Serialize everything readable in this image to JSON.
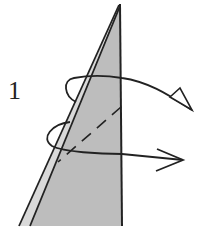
{
  "diagram": {
    "type": "origami-folding-step",
    "step_number": "1",
    "colors": {
      "paper_fill": "#bdbdbd",
      "line": "#222222",
      "background": "#ffffff"
    },
    "elements": [
      {
        "name": "folded-paper-flap",
        "shape": "narrow triangle, apex at top, shaded gray"
      },
      {
        "name": "valley-fold-line",
        "style": "dashed"
      },
      {
        "name": "turn-over-arrow",
        "style": "curved arrow with hollow triangular head, pointing right"
      },
      {
        "name": "fold-behind-arrow",
        "style": "looping arrow with open head, pointing right"
      }
    ]
  }
}
